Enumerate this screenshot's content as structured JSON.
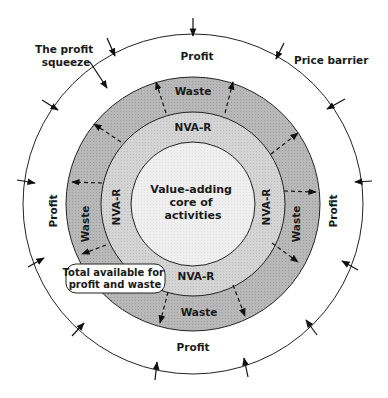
{
  "diagram": {
    "center": {
      "x": 193,
      "y": 204
    },
    "rings": [
      {
        "name": "profit",
        "radius": 170,
        "fill": "#ffffff"
      },
      {
        "name": "waste",
        "radius": 127,
        "fill": "#b4b4b4"
      },
      {
        "name": "nva-r",
        "radius": 92,
        "fill": "#d2d2d2"
      },
      {
        "name": "core",
        "radius": 62,
        "fill": "#eeeeee"
      }
    ],
    "labels": {
      "core_line1": "Value-adding",
      "core_line2": "core of",
      "core_line3": "activities",
      "nvar_top": "NVA-R",
      "nvar_bottom": "NVA-R",
      "nvar_left": "NVA-R",
      "nvar_right": "NVA-R",
      "waste_top": "Waste",
      "waste_bottom": "Waste",
      "waste_left": "Waste",
      "waste_right": "Waste",
      "profit_top": "Profit",
      "profit_bottom": "Profit",
      "profit_left": "Profit",
      "profit_right": "Profit",
      "profit_squeeze_line1": "The profit",
      "profit_squeeze_line2": "squeeze",
      "price_barrier": "Price barrier",
      "total_line1": "Total available for",
      "total_line2": "profit and waste"
    },
    "colors": {
      "stroke": "#222222",
      "waste_fill": "#b4b4b4",
      "nvar_fill": "#d2d2d2",
      "core_fill": "#eeeeee",
      "profit_fill": "#ffffff"
    }
  }
}
